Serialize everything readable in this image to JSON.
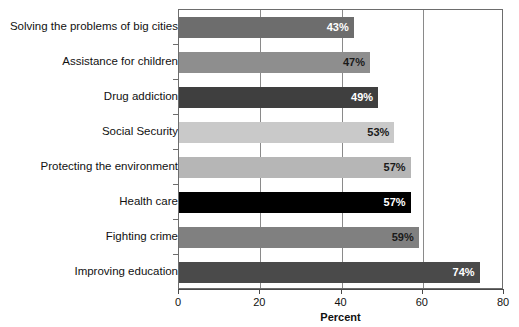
{
  "chart_data": {
    "type": "bar",
    "orientation": "horizontal",
    "title": "",
    "xlabel": "Percent",
    "ylabel": "",
    "xlim": [
      0,
      80
    ],
    "xticks": [
      0,
      20,
      40,
      60,
      80
    ],
    "grid": true,
    "legend": null,
    "categories": [
      "Solving the problems of big cities",
      "Assistance for children",
      "Drug addiction",
      "Social Security",
      "Protecting the environment",
      "Health care",
      "Fighting crime",
      "Improving education"
    ],
    "values": [
      43,
      47,
      49,
      53,
      57,
      57,
      59,
      74
    ],
    "value_labels": [
      "43%",
      "47%",
      "49%",
      "53%",
      "57%",
      "57%",
      "59%",
      "74%"
    ],
    "bar_colors": [
      "#6d6d6d",
      "#8e8e8e",
      "#3f3f3f",
      "#c9c9c9",
      "#b6b6b6",
      "#000000",
      "#808080",
      "#4a4a4a"
    ],
    "label_colors": [
      "#ffffff",
      "#1a1a1a",
      "#ffffff",
      "#1a1a1a",
      "#1a1a1a",
      "#ffffff",
      "#1a1a1a",
      "#ffffff"
    ]
  },
  "axis": {
    "tick_labels": [
      "0",
      "20",
      "40",
      "60",
      "80"
    ],
    "x_title": "Percent"
  },
  "style": {
    "frame_color": "#6d6d6d",
    "grid_color": "#8a8a8a",
    "background": "#ffffff"
  }
}
